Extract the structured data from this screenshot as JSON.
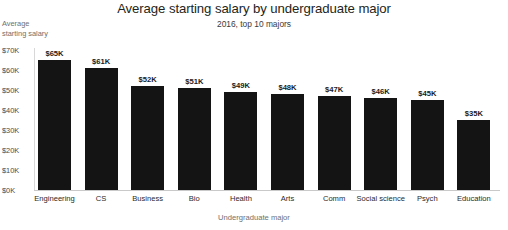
{
  "chart_data": {
    "type": "bar",
    "title": "Average starting salary by undergraduate major",
    "subtitle": "2016, top 10 majors",
    "xlabel": "Undergraduate major",
    "ylabel": "Average starting salary",
    "ylabel_line1": "Average",
    "ylabel_line2": "starting salary",
    "categories": [
      "Engineering",
      "CS",
      "Business",
      "Bio",
      "Health",
      "Arts",
      "Comm",
      "Social science",
      "Psych",
      "Education"
    ],
    "values": [
      65,
      61,
      52,
      51,
      49,
      48,
      47,
      46,
      45,
      35
    ],
    "value_labels": [
      "$65K",
      "$61K",
      "$52K",
      "$51K",
      "$49K",
      "$48K",
      "$47K",
      "$46K",
      "$45K",
      "$35K"
    ],
    "ylim": [
      0,
      70
    ],
    "yticks": [
      70,
      60,
      50,
      40,
      30,
      20,
      10,
      0
    ],
    "ytick_labels": [
      "$70K",
      "$60K",
      "$50K",
      "$40K",
      "$30K",
      "$20K",
      "$10K",
      "$0K"
    ],
    "grid": false,
    "legend": false,
    "bar_color": "#141414",
    "axis_color": "#c9c9c9",
    "text_color": "#231f20",
    "muted_text_color": "#6f6f6f",
    "units": "thousands of US dollars"
  }
}
